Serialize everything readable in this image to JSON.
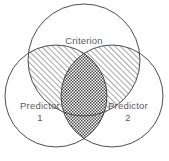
{
  "figure": {
    "type": "venn-diagram",
    "background_color": "#ffffff",
    "stroke_color": "#3a3a3a",
    "label_color": "#5a5a5a"
  },
  "sets": {
    "criterion": {
      "label": "Criterion",
      "cx": 84,
      "cy": 60,
      "r": 56
    },
    "predictor1": {
      "label_line1": "Predictor",
      "label_line2": "1",
      "cx": 56,
      "cy": 96,
      "r": 51
    },
    "predictor2": {
      "label_line1": "Predictor",
      "label_line2": "2",
      "cx": 112,
      "cy": 96,
      "r": 51
    }
  },
  "regions": {
    "criterion_predictor1": {
      "name": "criterion-predictor1-overlap",
      "fill": "diagonal-hatch"
    },
    "criterion_predictor2": {
      "name": "criterion-predictor2-overlap",
      "fill": "diagonal-hatch"
    },
    "predictor1_predictor2": {
      "name": "predictor1-predictor2-overlap",
      "fill": "cross-hatch"
    }
  }
}
